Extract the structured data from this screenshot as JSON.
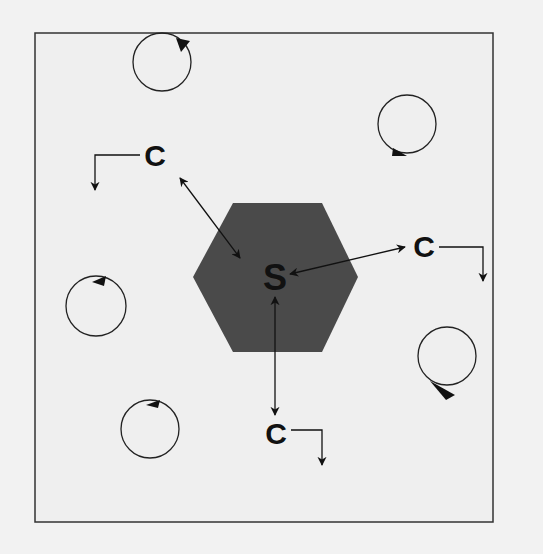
{
  "diagram": {
    "colors": {
      "background": "#f2f2f2",
      "frame": "#333333",
      "hexagon": "#4a4a4a",
      "ink": "#111111"
    },
    "center": {
      "label": "S",
      "shape": "hexagon"
    },
    "nodes": [
      {
        "id": "c-top-left",
        "label": "C"
      },
      {
        "id": "c-right",
        "label": "C"
      },
      {
        "id": "c-bottom",
        "label": "C"
      }
    ],
    "rotation_icons": [
      {
        "id": "rot-top",
        "direction": "clockwise"
      },
      {
        "id": "rot-top-right",
        "direction": "clockwise"
      },
      {
        "id": "rot-left",
        "direction": "counterclockwise"
      },
      {
        "id": "rot-bottom-left",
        "direction": "clockwise"
      },
      {
        "id": "rot-right",
        "direction": "counterclockwise"
      }
    ]
  }
}
